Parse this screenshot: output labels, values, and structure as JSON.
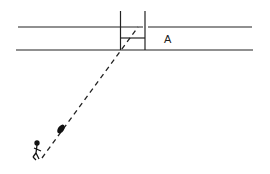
{
  "diagram": {
    "type": "field-goal-kick-illustration",
    "labels": {
      "region": "A"
    },
    "elements": {
      "field_lines": 2,
      "goal_posts": "H-shaped posts with crossbar",
      "ball": "football in flight",
      "kicker": "stick figure kicker",
      "trajectory": "dashed line from kicker to between posts"
    },
    "colors": {
      "stroke": "#222222",
      "background": "#ffffff"
    }
  }
}
